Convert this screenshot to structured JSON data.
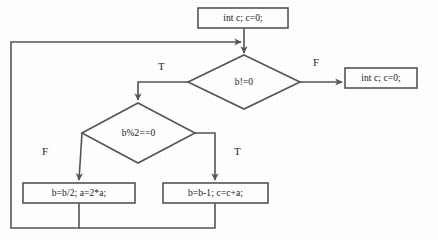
{
  "diagram": {
    "type": "flowchart",
    "title": "",
    "line_color": "#555555",
    "text_color": "#1a1a1a",
    "background": "#ffffff",
    "nodes": [
      {
        "id": "init",
        "shape": "process",
        "label": "int c; c=0;",
        "x": 198,
        "y": 8,
        "w": 90,
        "h": 20
      },
      {
        "id": "cond_loop",
        "shape": "decision",
        "label": "b!=0",
        "cx": 244,
        "cy": 82,
        "w": 112,
        "h": 55
      },
      {
        "id": "exit",
        "shape": "process",
        "label": "int c; c=0;",
        "x": 345,
        "y": 68,
        "w": 72,
        "h": 20
      },
      {
        "id": "cond_even",
        "shape": "decision",
        "label": "b%2==0",
        "cx": 138,
        "cy": 133,
        "w": 113,
        "h": 60
      },
      {
        "id": "halve",
        "shape": "process",
        "label": "b=b/2; a=2*a;",
        "x": 23,
        "y": 183,
        "w": 112,
        "h": 20
      },
      {
        "id": "decrement",
        "shape": "process",
        "label": "b=b-1; c=c+a;",
        "x": 163,
        "y": 183,
        "w": 105,
        "h": 20
      }
    ],
    "edges": [
      {
        "id": "e-init-cond",
        "from": "init",
        "to": "cond_loop",
        "label": ""
      },
      {
        "id": "e-cond-exit",
        "from": "cond_loop",
        "to": "exit",
        "label": "F"
      },
      {
        "id": "e-cond-even",
        "from": "cond_loop",
        "to": "cond_even",
        "label": "T"
      },
      {
        "id": "e-even-halve",
        "from": "cond_even",
        "to": "halve",
        "label": "F"
      },
      {
        "id": "e-even-dec",
        "from": "cond_even",
        "to": "decrement",
        "label": "T"
      },
      {
        "id": "e-loopback",
        "from": "halve,decrement",
        "to": "cond_loop",
        "label": ""
      }
    ],
    "edge_labels": {
      "cond_loop_true": "T",
      "cond_loop_false": "F",
      "cond_even_false": "F",
      "cond_even_true": "T"
    }
  }
}
